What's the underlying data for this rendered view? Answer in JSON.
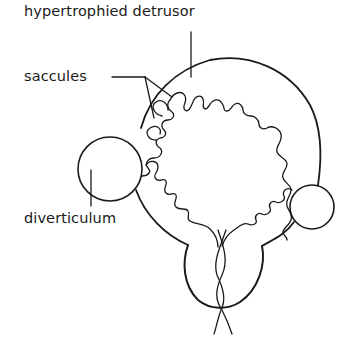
{
  "figure": {
    "type": "anatomical line diagram",
    "colors": {
      "line": "#1a1a1a",
      "background": "#ffffff"
    }
  },
  "labels": {
    "detrusor": "hypertrophied detrusor",
    "saccules": "saccules",
    "diverticulum": "diverticulum"
  },
  "parts": [
    {
      "name": "bladder-wall",
      "description": "outer outline of the bladder (hypertrophied detrusor)"
    },
    {
      "name": "mucosa-lining",
      "description": "wavy inner lining showing trabeculation"
    },
    {
      "name": "saccules",
      "description": "small outpouchings of the mucosa into the muscular wall"
    },
    {
      "name": "diverticulum-left",
      "description": "large circular pouch protruding on the left"
    },
    {
      "name": "diverticulum-right",
      "description": "smaller circular pouch protruding on the right"
    },
    {
      "name": "prostate",
      "description": "rounded structure at the bladder base"
    },
    {
      "name": "urethra",
      "description": "paired crossing lines exiting downward"
    }
  ]
}
